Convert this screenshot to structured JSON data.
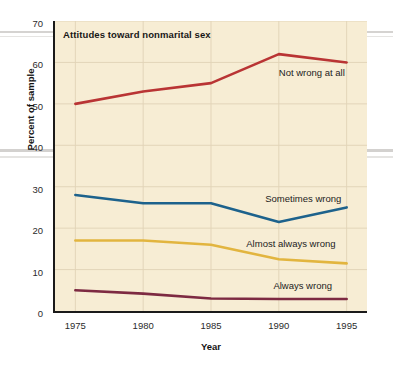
{
  "chart_data": {
    "type": "line",
    "title": "Attitudes toward nonmarital sex",
    "xlabel": "Year",
    "ylabel": "Percent of sample",
    "x": [
      1975,
      1980,
      1985,
      1990,
      1995
    ],
    "xticklabels": [
      "1975",
      "1980",
      "1985",
      "1990",
      "1995"
    ],
    "yticklabels": [
      "0",
      "10",
      "20",
      "30",
      "40",
      "50",
      "60",
      "70"
    ],
    "yticks": [
      0,
      10,
      20,
      30,
      40,
      50,
      60,
      70
    ],
    "xlim": [
      1973.5,
      1996.5
    ],
    "ylim": [
      0,
      70
    ],
    "grid": true,
    "legend_position": "inline-right",
    "plot_background": "#f7edd4",
    "series": [
      {
        "name": "Not wrong at all",
        "color": "#b93434",
        "values": [
          50,
          53,
          55,
          62,
          60
        ],
        "label_x": 1990.0,
        "label_y": 57.5
      },
      {
        "name": "Sometimes wrong",
        "color": "#1d628c",
        "values": [
          28,
          26,
          26,
          21.5,
          25
        ],
        "label_x": 1989.0,
        "label_y": 27.0
      },
      {
        "name": "Almost always wrong",
        "color": "#e2b53f",
        "values": [
          17,
          17,
          16,
          12.5,
          11.5
        ],
        "label_x": 1987.6,
        "label_y": 16.2
      },
      {
        "name": "Always wrong",
        "color": "#7d2a42",
        "values": [
          5,
          4.2,
          3,
          2.9,
          2.9
        ],
        "label_x": 1989.6,
        "label_y": 6.1
      }
    ]
  }
}
